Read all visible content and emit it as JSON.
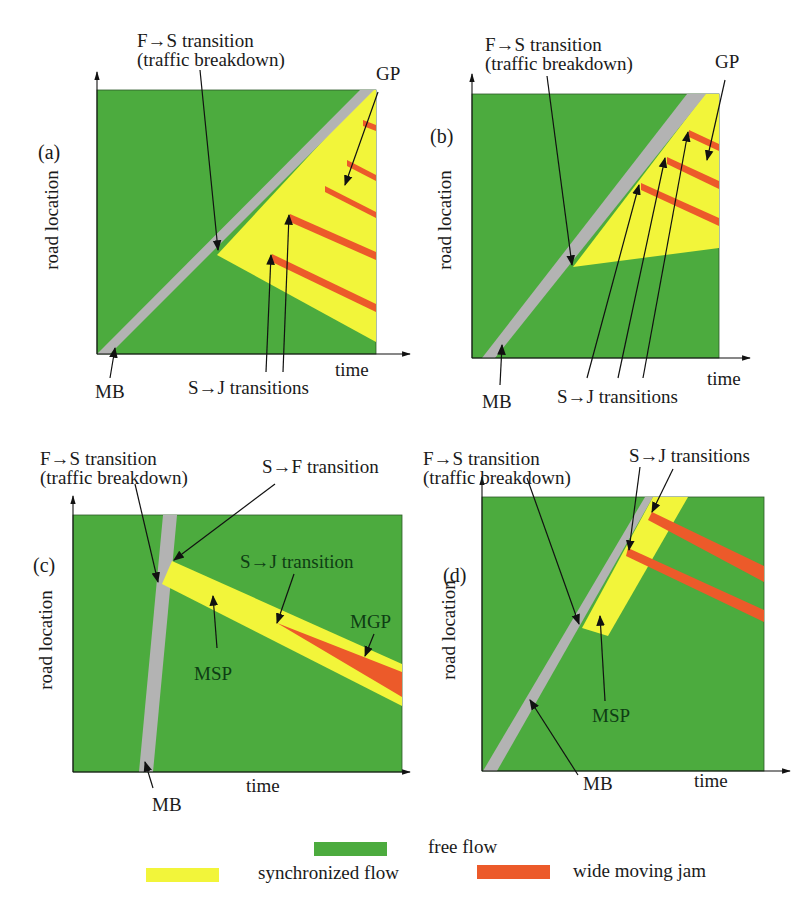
{
  "colors": {
    "free_flow": "#4cab3e",
    "synchronized_flow": "#f2f53a",
    "wide_moving_jam": "#ec5a2a",
    "moving_bottleneck": "#b3b3b3",
    "dark_label": "#0e3d14",
    "ink": "#1a1a1a"
  },
  "legend": [
    {
      "key": "free_flow",
      "label": "free flow",
      "swatch": [
        314,
        842,
        73,
        14
      ],
      "text_xy": [
        428,
        853
      ]
    },
    {
      "key": "synchronized_flow",
      "label": "synchronized flow",
      "swatch": [
        146,
        868,
        73,
        14
      ],
      "text_xy": [
        258,
        879
      ]
    },
    {
      "key": "wide_moving_jam",
      "label": "wide moving jam",
      "swatch": [
        477,
        865,
        73,
        14
      ],
      "text_xy": [
        573,
        877
      ]
    }
  ],
  "panels": [
    {
      "id": "a",
      "panel_label": "(a)",
      "panel_label_xy": [
        38,
        159
      ],
      "frame": [
        97,
        90,
        279,
        264
      ],
      "y_axis_top": 72,
      "x_axis_end": 410,
      "axis_labels": {
        "x": "time",
        "y": "road location",
        "x_xy": [
          335,
          376
        ],
        "y_xy": [
          58,
          220
        ]
      },
      "polygons": [
        {
          "type": "synchronized",
          "points": "370,90 376,90 376,342 217,255"
        },
        {
          "type": "mb",
          "points": "360,90 374,90 110,354 97,354"
        },
        {
          "type": "jam",
          "points": "363,120 376,125 376,131 363,126"
        },
        {
          "type": "jam",
          "points": "347,160 376,175 376,181 347,166"
        },
        {
          "type": "jam",
          "points": "325,186 376,212 376,218 325,192"
        },
        {
          "type": "jam",
          "points": "290,214 376,252 376,260 290,222"
        },
        {
          "type": "jam",
          "points": "272,254 376,304 376,312 272,262"
        }
      ],
      "annotations": [
        {
          "lines": [
            "F→S transition",
            "(traffic breakdown)"
          ],
          "xy": [
            137,
            47
          ],
          "dy": 19,
          "dark": false,
          "arrow": [
            [
              200,
              70
            ],
            [
              218,
              250
            ]
          ]
        },
        {
          "lines": [
            "GP"
          ],
          "xy": [
            376,
            80
          ],
          "dy": 0,
          "dark": false,
          "arrow": [
            [
              378,
              92
            ],
            [
              345,
              185
            ]
          ]
        },
        {
          "lines": [
            "S→J transitions"
          ],
          "xy": [
            188,
            394
          ],
          "dy": 0,
          "dark": false,
          "arrows": [
            [
              [
                266,
                372
              ],
              [
                271,
                255
              ]
            ],
            [
              [
                283,
                372
              ],
              [
                289,
                215
              ]
            ]
          ]
        },
        {
          "lines": [
            "MB"
          ],
          "xy": [
            95,
            398
          ],
          "dy": 0,
          "dark": false,
          "arrow": [
            [
              110,
              378
            ],
            [
              115,
              348
            ]
          ]
        }
      ]
    },
    {
      "id": "b",
      "panel_label": "(b)",
      "panel_label_xy": [
        430,
        143
      ],
      "frame": [
        472,
        94,
        247,
        264
      ],
      "y_axis_top": 74,
      "x_axis_end": 750,
      "axis_labels": {
        "x": "time",
        "y": "road location",
        "x_xy": [
          707,
          385
        ],
        "y_xy": [
          451,
          220
        ]
      },
      "polygons": [
        {
          "type": "synchronized",
          "points": "705,94 719,94 719,248 573,267"
        },
        {
          "type": "mb",
          "points": "687,94 706,94 495,358 482,358"
        },
        {
          "type": "jam",
          "points": "689,130 719,144 719,151 689,137"
        },
        {
          "type": "jam",
          "points": "667,157 719,181 719,189 667,164"
        },
        {
          "type": "jam",
          "points": "641,183 719,218 719,226 641,190"
        }
      ],
      "annotations": [
        {
          "lines": [
            "F→S transition",
            "(traffic breakdown)"
          ],
          "xy": [
            485,
            51
          ],
          "dy": 19,
          "dark": false,
          "arrow": [
            [
              547,
              76
            ],
            [
              572,
              265
            ]
          ]
        },
        {
          "lines": [
            "GP"
          ],
          "xy": [
            715,
            68
          ],
          "dy": 0,
          "dark": false,
          "arrow": [
            [
              725,
              80
            ],
            [
              707,
              160
            ]
          ]
        },
        {
          "lines": [
            "S→J transitions"
          ],
          "xy": [
            557,
            403
          ],
          "dy": 0,
          "dark": false,
          "arrows": [
            [
              [
                587,
                378
              ],
              [
                639,
                185
              ]
            ],
            [
              [
                618,
                378
              ],
              [
                665,
                158
              ]
            ],
            [
              [
                643,
                378
              ],
              [
                688,
                132
              ]
            ]
          ]
        },
        {
          "lines": [
            "MB"
          ],
          "xy": [
            482,
            408
          ],
          "dy": 0,
          "dark": false,
          "arrow": [
            [
              500,
              385
            ],
            [
              502,
              345
            ]
          ]
        }
      ]
    },
    {
      "id": "c",
      "panel_label": "(c)",
      "panel_label_xy": [
        33,
        572
      ],
      "frame": [
        73,
        515,
        329,
        257
      ],
      "y_axis_top": 496,
      "x_axis_end": 410,
      "axis_labels": {
        "x": "time",
        "y": "road location",
        "x_xy": [
          246,
          792
        ],
        "y_xy": [
          52,
          640
        ]
      },
      "polygons": [
        {
          "type": "mb",
          "points": "163,515 177,515 153,772 139,772"
        },
        {
          "type": "synchronized",
          "points": "172,561 402,664 402,706 162,584"
        },
        {
          "type": "jam",
          "points": "277,623 402,672 402,697"
        }
      ],
      "annotations": [
        {
          "lines": [
            "F→S transition",
            "(traffic breakdown)"
          ],
          "xy": [
            40,
            465
          ],
          "dy": 19,
          "dark": false,
          "arrow": [
            [
              135,
              484
            ],
            [
              158,
              582
            ]
          ]
        },
        {
          "lines": [
            "S→F transition"
          ],
          "xy": [
            262,
            473
          ],
          "dy": 0,
          "dark": false,
          "arrow": [
            [
              275,
              484
            ],
            [
              174,
              560
            ]
          ]
        },
        {
          "lines": [
            "S→J transition"
          ],
          "xy": [
            240,
            568
          ],
          "dy": 0,
          "dark": true,
          "arrow": [
            [
              294,
              574
            ],
            [
              277,
              623
            ]
          ]
        },
        {
          "lines": [
            "MGP"
          ],
          "xy": [
            350,
            628
          ],
          "dy": 0,
          "dark": true,
          "arrow": [
            [
              374,
              634
            ],
            [
              365,
              656
            ]
          ]
        },
        {
          "lines": [
            "MSP"
          ],
          "xy": [
            194,
            680
          ],
          "dy": 0,
          "dark": true,
          "arrow": [
            [
              217,
              648
            ],
            [
              213,
              596
            ]
          ]
        },
        {
          "lines": [
            "MB"
          ],
          "xy": [
            152,
            811
          ],
          "dy": 0,
          "dark": false,
          "arrow": [
            [
              153,
              788
            ],
            [
              145,
              762
            ]
          ]
        }
      ]
    },
    {
      "id": "d",
      "panel_label": "(d)",
      "panel_label_xy": [
        443,
        582
      ],
      "frame": [
        482,
        497,
        282,
        274
      ],
      "y_axis_top": 477,
      "x_axis_end": 790,
      "axis_labels": {
        "x": "time",
        "y": "road location",
        "x_xy": [
          694,
          787
        ],
        "y_xy": [
          455,
          630
        ]
      },
      "polygons": [
        {
          "type": "mb",
          "points": "645,497 653,497 497,771 483,771"
        },
        {
          "type": "synchronized",
          "points": "653,497 688,497 608,636 582,628"
        },
        {
          "type": "jam",
          "points": "652,512 764,566 764,582 648,520"
        },
        {
          "type": "jam",
          "points": "628,548 764,610 764,622 626,556"
        }
      ],
      "annotations": [
        {
          "lines": [
            "F→S transition",
            "(traffic breakdown)"
          ],
          "xy": [
            423,
            465
          ],
          "dy": 19,
          "dark": false,
          "arrow": [
            [
              527,
              478
            ],
            [
              579,
              624
            ]
          ]
        },
        {
          "lines": [
            "S→J transitions"
          ],
          "xy": [
            629,
            462
          ],
          "dy": 0,
          "dark": false,
          "arrows": [
            [
              [
                640,
                467
              ],
              [
                629,
                550
              ]
            ],
            [
              [
                673,
                469
              ],
              [
                652,
                512
              ]
            ]
          ]
        },
        {
          "lines": [
            "MSP"
          ],
          "xy": [
            592,
            722
          ],
          "dy": 0,
          "dark": true,
          "arrow": [
            [
              605,
              701
            ],
            [
              600,
              616
            ]
          ]
        },
        {
          "lines": [
            "MB"
          ],
          "xy": [
            583,
            790
          ],
          "dy": 0,
          "dark": false,
          "arrow": [
            [
              578,
              775
            ],
            [
              530,
              700
            ]
          ]
        }
      ]
    }
  ]
}
